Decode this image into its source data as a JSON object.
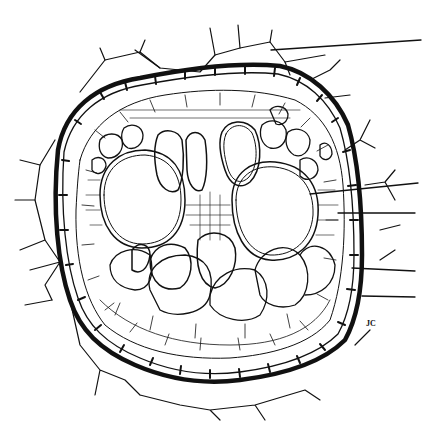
{
  "figure": {
    "stroke_color": "#111111",
    "background": "#ffffff",
    "signature": "JC",
    "leader_lines": [
      {
        "id": 1,
        "from": [
          271,
          50
        ],
        "to": [
          421,
          40
        ],
        "label": ""
      },
      {
        "id": 2,
        "from": [
          310,
          194
        ],
        "to": [
          418,
          183
        ],
        "label": ""
      },
      {
        "id": 3,
        "from": [
          338,
          213
        ],
        "to": [
          415,
          213
        ],
        "label": ""
      },
      {
        "id": 4,
        "from": [
          352,
          268
        ],
        "to": [
          415,
          271
        ],
        "label": ""
      },
      {
        "id": 5,
        "from": [
          362,
          296
        ],
        "to": [
          415,
          297
        ],
        "label": ""
      }
    ],
    "regions": [
      "epidermis/outer cortex cells with hair-like projections",
      "endodermis (thickened ring)",
      "pericycle",
      "phloem",
      "xylem vessels (large)",
      "parenchyma"
    ]
  }
}
